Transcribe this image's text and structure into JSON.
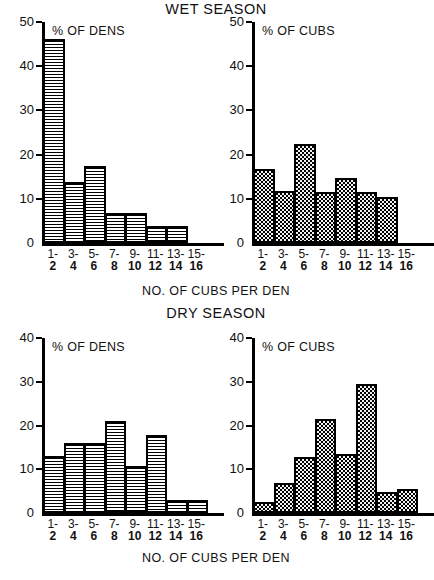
{
  "figure": {
    "wet_season_title": "WET SEASON",
    "dry_season_title": "DRY SEASON",
    "caption_top": "NO. OF CUBS PER DEN",
    "caption_bottom": "NO. OF CUBS PER DEN"
  },
  "chart_data": [
    {
      "id": "wet-dens",
      "type": "bar",
      "title": "% OF DENS",
      "subtitle": "WET SEASON",
      "xlabel": "NO. OF CUBS PER DEN",
      "ylabel": "% OF DENS",
      "categories": [
        "1-2",
        "3-4",
        "5-6",
        "7-8",
        "9-10",
        "11-12",
        "13-14",
        "15-16"
      ],
      "category_lines": [
        [
          "1-",
          "2"
        ],
        [
          "3-",
          "4"
        ],
        [
          "5-",
          "6"
        ],
        [
          "7-",
          "8"
        ],
        [
          "9-",
          "10"
        ],
        [
          "11-",
          "12"
        ],
        [
          "13-",
          "14"
        ],
        [
          "15-",
          "16"
        ]
      ],
      "values": [
        46.2,
        13.8,
        17.5,
        6.9,
        6.9,
        3.8,
        3.8,
        0
      ],
      "ylim": [
        0,
        50
      ],
      "yticks": [
        0,
        10,
        20,
        30,
        40,
        50
      ],
      "grid": false,
      "legend": "none",
      "fill": "horizontal-hatch"
    },
    {
      "id": "wet-cubs",
      "type": "bar",
      "title": "% OF CUBS",
      "subtitle": "WET SEASON",
      "xlabel": "NO. OF CUBS PER DEN",
      "ylabel": "% OF CUBS",
      "categories": [
        "1-2",
        "3-4",
        "5-6",
        "7-8",
        "9-10",
        "11-12",
        "13-14",
        "15-16"
      ],
      "category_lines": [
        [
          "1-",
          "2"
        ],
        [
          "3-",
          "4"
        ],
        [
          "5-",
          "6"
        ],
        [
          "7-",
          "8"
        ],
        [
          "9-",
          "10"
        ],
        [
          "11-",
          "12"
        ],
        [
          "13-",
          "14"
        ],
        [
          "15-",
          "16"
        ]
      ],
      "values": [
        16.8,
        11.7,
        22.5,
        11.6,
        14.8,
        11.5,
        10.5,
        0
      ],
      "ylim": [
        0,
        50
      ],
      "yticks": [
        0,
        10,
        20,
        30,
        40,
        50
      ],
      "grid": false,
      "legend": "none",
      "fill": "stipple-dots"
    },
    {
      "id": "dry-dens",
      "type": "bar",
      "title": "% OF DENS",
      "subtitle": "DRY SEASON",
      "xlabel": "NO. OF CUBS PER DEN",
      "ylabel": "% OF DENS",
      "categories": [
        "1-2",
        "3-4",
        "5-6",
        "7-8",
        "9-10",
        "11-12",
        "13-14",
        "15-16"
      ],
      "category_lines": [
        [
          "1-",
          "2"
        ],
        [
          "3-",
          "4"
        ],
        [
          "5-",
          "6"
        ],
        [
          "7-",
          "8"
        ],
        [
          "9-",
          "10"
        ],
        [
          "11-",
          "12"
        ],
        [
          "13-",
          "14"
        ],
        [
          "15-",
          "16"
        ]
      ],
      "values": [
        13.0,
        16.0,
        16.0,
        21.0,
        10.7,
        17.8,
        3.0,
        3.0
      ],
      "ylim": [
        0,
        40
      ],
      "yticks": [
        0,
        10,
        20,
        30,
        40
      ],
      "grid": false,
      "legend": "none",
      "fill": "horizontal-hatch"
    },
    {
      "id": "dry-cubs",
      "type": "bar",
      "title": "% OF CUBS",
      "subtitle": "DRY SEASON",
      "xlabel": "NO. OF CUBS PER DEN",
      "ylabel": "% OF CUBS",
      "categories": [
        "1-2",
        "3-4",
        "5-6",
        "7-8",
        "9-10",
        "11-12",
        "13-14",
        "15-16"
      ],
      "category_lines": [
        [
          "1-",
          "2"
        ],
        [
          "3-",
          "4"
        ],
        [
          "5-",
          "6"
        ],
        [
          "7-",
          "8"
        ],
        [
          "9-",
          "10"
        ],
        [
          "11-",
          "12"
        ],
        [
          "13-",
          "14"
        ],
        [
          "15-",
          "16"
        ]
      ],
      "values": [
        2.5,
        6.8,
        12.7,
        21.5,
        13.5,
        29.5,
        4.7,
        5.5
      ],
      "ylim": [
        0,
        40
      ],
      "yticks": [
        0,
        10,
        20,
        30,
        40
      ],
      "grid": false,
      "legend": "none",
      "fill": "stipple-dots"
    }
  ],
  "colors": {
    "ink": "#000000",
    "paper": "#ffffff"
  }
}
